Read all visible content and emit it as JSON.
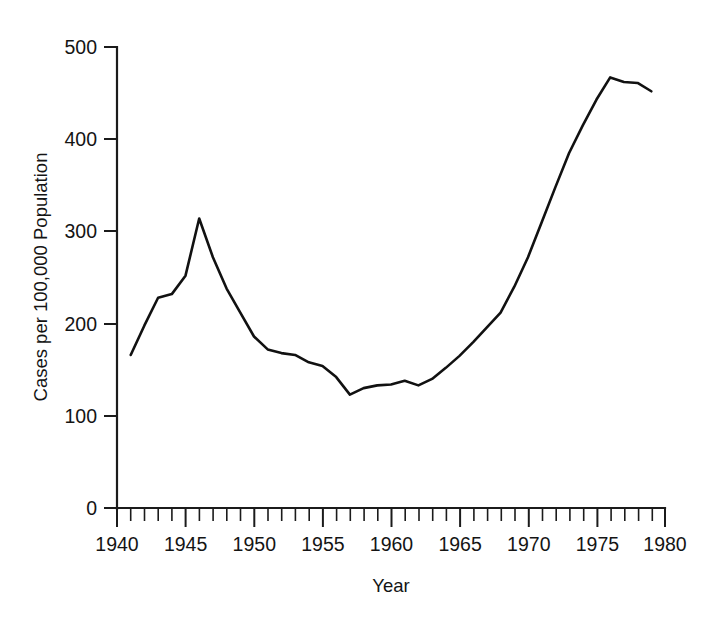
{
  "chart_data": {
    "type": "line",
    "title": "",
    "xlabel": "Year",
    "ylabel": "Cases per 100,000 Population",
    "xlim": [
      1940,
      1980
    ],
    "ylim": [
      0,
      500
    ],
    "grid": false,
    "legend": null,
    "x_tick_labels": [
      "1940",
      "1945",
      "1950",
      "1955",
      "1960",
      "1965",
      "1970",
      "1975",
      "1980"
    ],
    "x_major_ticks": [
      1940,
      1945,
      1950,
      1955,
      1960,
      1965,
      1970,
      1975,
      1980
    ],
    "x_minor_tick_interval": 1,
    "y_tick_labels": [
      "0",
      "100",
      "200",
      "300",
      "400",
      "500"
    ],
    "y_major_ticks": [
      0,
      100,
      200,
      300,
      400,
      500
    ],
    "series": [
      {
        "name": "Cases per 100,000 Population",
        "color": "#111111",
        "x": [
          1941,
          1942,
          1943,
          1944,
          1945,
          1946,
          1947,
          1948,
          1949,
          1950,
          1951,
          1952,
          1953,
          1954,
          1955,
          1956,
          1957,
          1958,
          1959,
          1960,
          1961,
          1962,
          1963,
          1964,
          1965,
          1966,
          1967,
          1968,
          1969,
          1970,
          1971,
          1972,
          1973,
          1974,
          1975,
          1976,
          1977,
          1978,
          1979
        ],
        "values": [
          166,
          198,
          228,
          232,
          252,
          314,
          272,
          238,
          212,
          186,
          172,
          168,
          166,
          158,
          154,
          142,
          123,
          130,
          133,
          134,
          138,
          133,
          140,
          152,
          165,
          180,
          196,
          212,
          240,
          272,
          310,
          348,
          385,
          415,
          443,
          467,
          462,
          461,
          452
        ]
      }
    ]
  },
  "axes": {
    "x_title": "Year",
    "y_title": "Cases per 100,000 Population"
  }
}
